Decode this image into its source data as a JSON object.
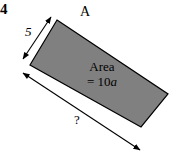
{
  "figure": {
    "problem_number": "4",
    "vertex_label": "A",
    "short_side_label": "5",
    "long_side_label": "?",
    "area_text_line1": "Area",
    "area_text_line2_prefix": "= 10",
    "area_text_line2_var": "a",
    "colors": {
      "fill": "#808080",
      "stroke": "#000000",
      "background": "#ffffff",
      "text": "#000000"
    },
    "shape": {
      "type": "rotated-rectangle",
      "points": "57,20 168,94 141,127 30,65"
    },
    "dimension_arrows": [
      {
        "name": "short-side-arrow",
        "label": "5",
        "x1": 23,
        "y1": 59,
        "x2": 51,
        "y2": 17,
        "double_headed": true
      },
      {
        "name": "long-side-arrow",
        "label": "?",
        "x1": 23,
        "y1": 73,
        "x2": 140,
        "y2": 150,
        "double_headed": true
      }
    ]
  }
}
